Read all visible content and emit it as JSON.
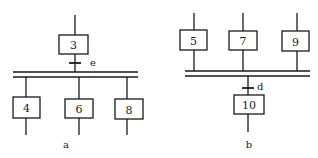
{
  "diagram_a": {
    "caption": "a",
    "type": "divergence (simultaneous branching)",
    "top_step": {
      "label": "3"
    },
    "transition": {
      "label": "e"
    },
    "branch_steps": [
      {
        "label": "4"
      },
      {
        "label": "6"
      },
      {
        "label": "8"
      }
    ]
  },
  "diagram_b": {
    "caption": "b",
    "type": "convergence (simultaneous merging)",
    "input_steps": [
      {
        "label": "5"
      },
      {
        "label": "7"
      },
      {
        "label": "9"
      }
    ],
    "transition": {
      "label": "d"
    },
    "bottom_step": {
      "label": "10"
    }
  },
  "colors": {
    "line": "#1a1a1a",
    "background": "#ffffff"
  }
}
